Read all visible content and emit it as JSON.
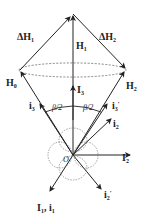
{
  "diagram": {
    "type": "vector-diagram",
    "colors": {
      "line": "#222222",
      "dashed": "#555555",
      "background": "#ffffff"
    },
    "labels": {
      "delta_h1": {
        "main": "ΔH",
        "sub": "1"
      },
      "delta_h2": {
        "main": "ΔH",
        "sub": "2"
      },
      "h1": {
        "main": "H",
        "sub": "1"
      },
      "h0": {
        "main": "H",
        "sub": "0"
      },
      "h2": {
        "main": "H",
        "sub": "2"
      },
      "i3_upper": {
        "main": "I",
        "sub": "3"
      },
      "i3_left": {
        "main": "i",
        "sub": "3"
      },
      "i3_prime": {
        "main": "i",
        "sub": "3",
        "prime": "′"
      },
      "beta_left": "β/2",
      "beta_right": "β/2",
      "i2": {
        "main": "i",
        "sub": "2"
      },
      "I2": {
        "main": "I",
        "sub": "2"
      },
      "origin": "O",
      "i2_prime": {
        "main": "i",
        "sub": "2",
        "prime": "′"
      },
      "I1_i1": {
        "main1": "I",
        "sub1": "1",
        "sep": ", ",
        "main2": "i",
        "sub2": "1"
      }
    }
  }
}
